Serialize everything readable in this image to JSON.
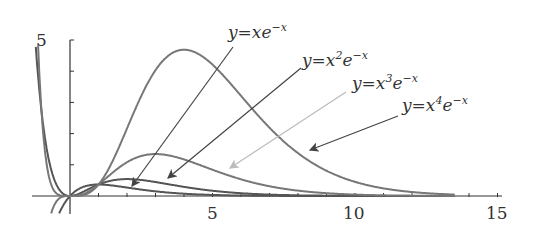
{
  "chart_data": {
    "type": "line",
    "title": "",
    "xlabel": "",
    "ylabel": "",
    "xlim": [
      -1.2,
      15.3
    ],
    "ylim": [
      -0.6,
      5
    ],
    "x_ticks": [
      5,
      10,
      15
    ],
    "y_ticks": [
      5
    ],
    "x_minor_ticks": [
      1,
      2,
      3,
      4,
      5,
      6,
      7,
      8,
      9,
      10,
      11,
      12,
      13,
      14,
      15
    ],
    "y_minor_ticks": [
      1,
      2,
      3,
      4,
      5
    ],
    "grid": false,
    "legend": "annotated-arrows",
    "series": [
      {
        "name": "y=xe^{-x}",
        "formula": "x*exp(-x)",
        "peak": {
          "x": 1,
          "y": 0.37
        },
        "color": "#555555"
      },
      {
        "name": "y=x^2e^{-x}",
        "formula": "x^2*exp(-x)",
        "peak": {
          "x": 2,
          "y": 0.54
        },
        "color": "#555555"
      },
      {
        "name": "y=x^3e^{-x}",
        "formula": "x^3*exp(-x)",
        "peak": {
          "x": 3,
          "y": 1.34
        },
        "color": "#777777"
      },
      {
        "name": "y=x^4e^{-x}",
        "formula": "x^4*exp(-x)",
        "peak": {
          "x": 4,
          "y": 4.69
        },
        "color": "#777777"
      }
    ]
  },
  "axis": {
    "x_tick_labels": [
      "5",
      "10",
      "15"
    ],
    "y_tick_labels": [
      "5"
    ]
  },
  "labels": [
    {
      "prefix": "y",
      "eq": "=",
      "base": "x",
      "power": "",
      "tail": "e",
      "exp": "−x"
    },
    {
      "prefix": "y",
      "eq": "=",
      "base": "x",
      "power": "2",
      "tail": "e",
      "exp": "−x"
    },
    {
      "prefix": "y",
      "eq": "=",
      "base": "x",
      "power": "3",
      "tail": "e",
      "exp": "−x"
    },
    {
      "prefix": "y",
      "eq": "=",
      "base": "x",
      "power": "4",
      "tail": "e",
      "exp": "−x"
    }
  ],
  "colors": {
    "axis": "#333333",
    "curve_dark": "#555555",
    "curve_mid": "#777777",
    "arrow_dark": "#444444",
    "arrow_light": "#bbbbbb"
  }
}
